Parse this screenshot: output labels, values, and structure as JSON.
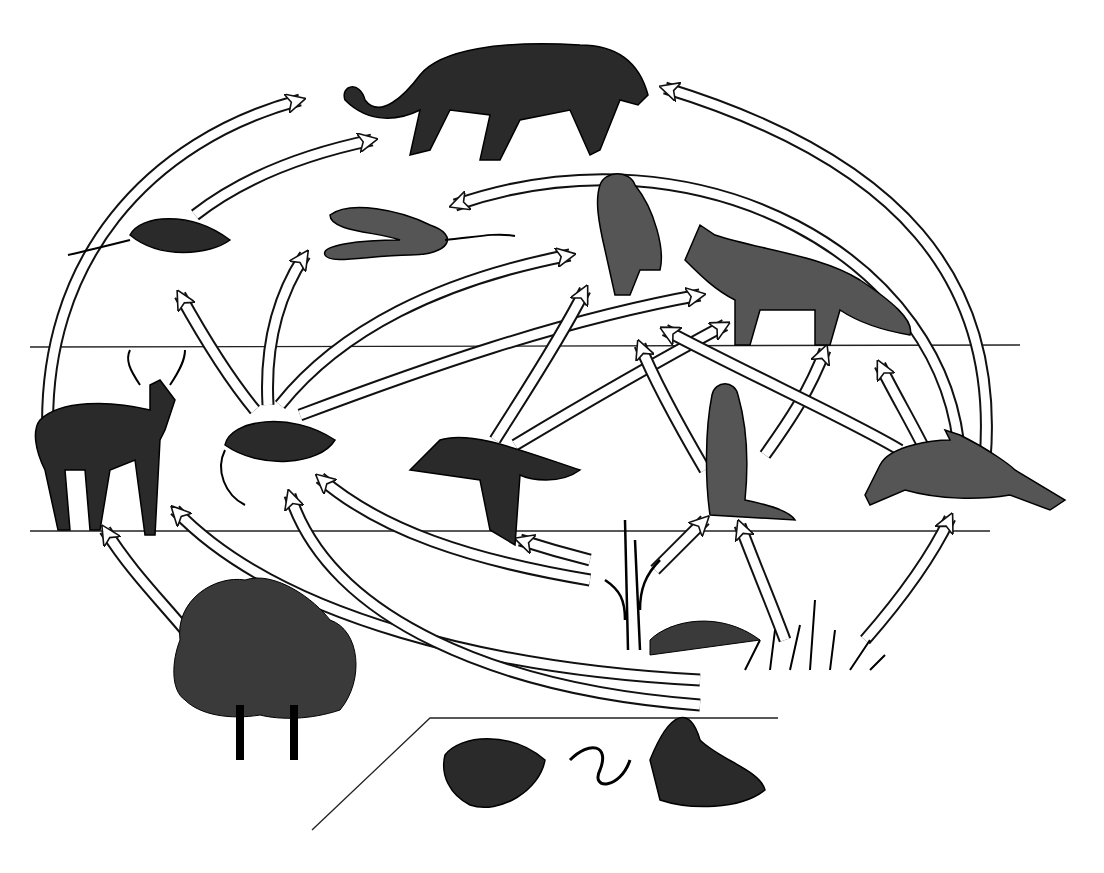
{
  "diagram": {
    "type": "food-web",
    "levels": [
      "tertiary consumers",
      "secondary consumers",
      "primary consumers",
      "producers",
      "decomposers"
    ],
    "organisms": [
      {
        "id": "mountain_lion",
        "x": 500,
        "y": 95
      },
      {
        "id": "shrew",
        "x": 160,
        "y": 235
      },
      {
        "id": "snake",
        "x": 410,
        "y": 240
      },
      {
        "id": "owl",
        "x": 630,
        "y": 225
      },
      {
        "id": "fox",
        "x": 800,
        "y": 280
      },
      {
        "id": "deer",
        "x": 105,
        "y": 440
      },
      {
        "id": "mouse",
        "x": 275,
        "y": 445
      },
      {
        "id": "bird",
        "x": 500,
        "y": 480
      },
      {
        "id": "ground_squirrel",
        "x": 735,
        "y": 450
      },
      {
        "id": "rabbit",
        "x": 965,
        "y": 475
      },
      {
        "id": "trees",
        "x": 265,
        "y": 660
      },
      {
        "id": "corn",
        "x": 630,
        "y": 600
      },
      {
        "id": "grass",
        "x": 810,
        "y": 640
      },
      {
        "id": "decomposers",
        "x": 600,
        "y": 770
      }
    ],
    "arrows": [
      {
        "from": "deer",
        "to": "mountain_lion",
        "d": "M48 440 C40 260,150 140,300 100"
      },
      {
        "from": "shrew",
        "to": "mountain_lion",
        "d": "M195 215 C240 180,300 155,372 140"
      },
      {
        "from": "rabbit",
        "to": "mountain_lion",
        "d": "M985 460 C1000 280,900 160,665 88"
      },
      {
        "from": "rabbit",
        "to": "snake",
        "d": "M960 460 C950 260,700 120,455 205"
      },
      {
        "from": "mouse",
        "to": "shrew",
        "d": "M255 410 C230 380,205 340,180 295"
      },
      {
        "from": "mouse",
        "to": "snake",
        "d": "M268 405 C265 350,275 300,305 255"
      },
      {
        "from": "mouse",
        "to": "owl",
        "d": "M280 405 C340 330,440 280,570 255"
      },
      {
        "from": "mouse",
        "to": "fox",
        "d": "M300 415 C420 370,560 320,700 295"
      },
      {
        "from": "bird",
        "to": "owl",
        "d": "M495 440 C520 400,560 340,585 290"
      },
      {
        "from": "bird",
        "to": "fox",
        "d": "M515 445 C590 400,660 360,725 325"
      },
      {
        "from": "ground_squirrel",
        "to": "fox",
        "d": "M765 455 C790 420,810 390,825 350"
      },
      {
        "from": "ground_squirrel",
        "to": "owl",
        "d": "M705 470 C670 410,650 370,640 345"
      },
      {
        "from": "rabbit",
        "to": "fox",
        "d": "M900 450 C850 420,760 380,665 330"
      },
      {
        "from": "rabbit",
        "to": "fox2",
        "d": "M925 450 C910 420,895 395,880 365"
      },
      {
        "from": "trees",
        "to": "deer",
        "d": "M185 630 C160 600,130 570,105 530"
      },
      {
        "from": "trees",
        "to": "mouse",
        "d": "M700 680 C500 670,280 620,175 510"
      },
      {
        "from": "decomposers",
        "to": "mouse",
        "d": "M700 705 C500 690,330 620,290 495"
      },
      {
        "from": "corn",
        "to": "mouse",
        "d": "M590 580 C470 560,380 530,320 478"
      },
      {
        "from": "corn",
        "to": "bird",
        "d": "M590 560 C570 555,545 548,520 540"
      },
      {
        "from": "corn",
        "to": "ground_squirrel",
        "d": "M655 570 C670 555,690 535,705 520"
      },
      {
        "from": "grass",
        "to": "ground_squirrel",
        "d": "M785 640 C770 600,755 565,740 525"
      },
      {
        "from": "grass",
        "to": "rabbit",
        "d": "M865 640 C900 600,930 560,950 518"
      }
    ]
  }
}
